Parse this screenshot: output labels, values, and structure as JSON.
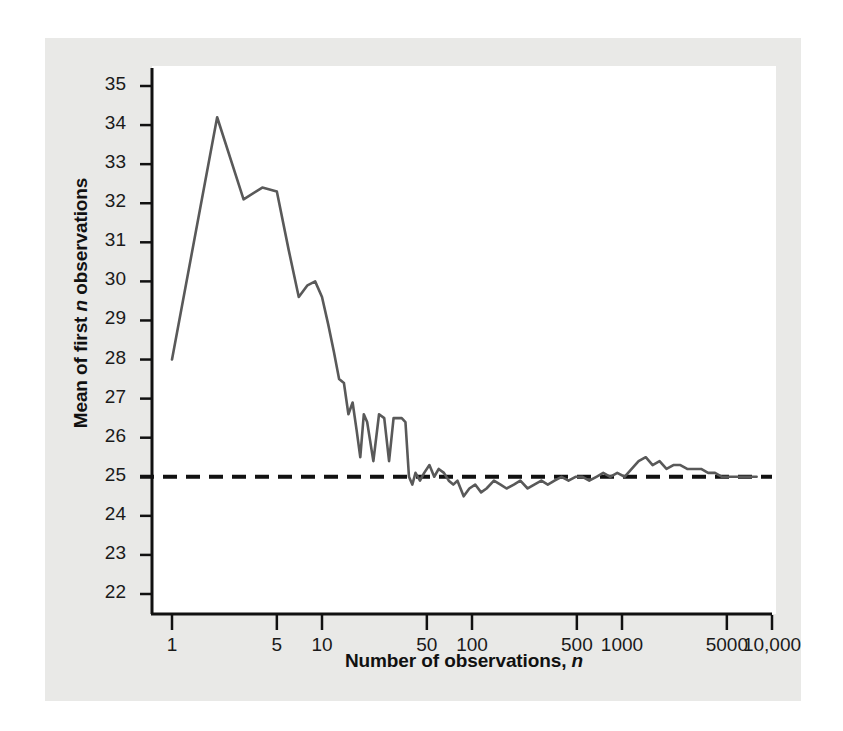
{
  "figure": {
    "background_color": "#e9e9e7",
    "plot_background_color": "#ffffff",
    "line_color": "#595959",
    "reference_line_color": "#111111",
    "axis_color": "#111111"
  },
  "chart_data": {
    "type": "line",
    "title": "",
    "xlabel": "Number of observations, n",
    "ylabel": "Mean of first n observations",
    "xscale": "log",
    "yscale": "linear",
    "xlim": [
      1,
      10000
    ],
    "ylim": [
      22,
      35
    ],
    "grid": false,
    "legend": null,
    "xticks": [
      1,
      5,
      10,
      50,
      100,
      500,
      1000,
      5000,
      10000
    ],
    "xtick_labels": [
      "1",
      "5",
      "10",
      "50",
      "100",
      "500",
      "1000",
      "5000",
      "10,000"
    ],
    "yticks": [
      22,
      23,
      24,
      25,
      26,
      27,
      28,
      29,
      30,
      31,
      32,
      33,
      34,
      35
    ],
    "ytick_labels": [
      "22",
      "23",
      "24",
      "25",
      "26",
      "27",
      "28",
      "29",
      "30",
      "31",
      "32",
      "33",
      "34",
      "35"
    ],
    "reference_line": {
      "orientation": "horizontal",
      "value": 25,
      "style": "dashed",
      "label": ""
    },
    "series": [
      {
        "name": "Running mean",
        "style": "solid",
        "x": [
          1,
          2,
          3,
          4,
          5,
          6,
          7,
          8,
          9,
          10,
          11,
          12,
          13,
          14,
          15,
          16,
          17,
          18,
          19,
          20,
          22,
          24,
          26,
          28,
          30,
          32,
          34,
          36,
          38,
          40,
          42,
          45,
          48,
          52,
          56,
          60,
          65,
          70,
          75,
          80,
          88,
          96,
          105,
          115,
          125,
          140,
          155,
          170,
          190,
          210,
          235,
          260,
          290,
          320,
          355,
          395,
          440,
          490,
          545,
          605,
          675,
          750,
          835,
          930,
          1040,
          1160,
          1290,
          1440,
          1600,
          1780,
          1980,
          2200,
          2450,
          2720,
          3030,
          3370,
          3750,
          4170,
          4640,
          5160,
          5740,
          6390,
          7110,
          7900
        ],
        "y": [
          28.0,
          34.2,
          32.1,
          32.4,
          32.3,
          30.8,
          29.6,
          29.9,
          30.0,
          29.6,
          28.9,
          28.2,
          27.5,
          27.4,
          26.6,
          26.9,
          26.2,
          25.5,
          26.6,
          26.4,
          25.4,
          26.6,
          26.5,
          25.4,
          26.5,
          26.5,
          26.5,
          26.4,
          25.0,
          24.8,
          25.1,
          24.9,
          25.1,
          25.3,
          25.0,
          25.2,
          25.1,
          24.9,
          24.8,
          24.9,
          24.5,
          24.7,
          24.8,
          24.6,
          24.7,
          24.9,
          24.8,
          24.7,
          24.8,
          24.9,
          24.7,
          24.8,
          24.9,
          24.8,
          24.9,
          25.0,
          24.9,
          25.0,
          25.0,
          24.9,
          25.0,
          25.1,
          25.0,
          25.1,
          25.0,
          25.2,
          25.4,
          25.5,
          25.3,
          25.4,
          25.2,
          25.3,
          25.3,
          25.2,
          25.2,
          25.2,
          25.1,
          25.1,
          25.0,
          25.0,
          25.0,
          25.0,
          25.0,
          25.0
        ]
      }
    ]
  }
}
